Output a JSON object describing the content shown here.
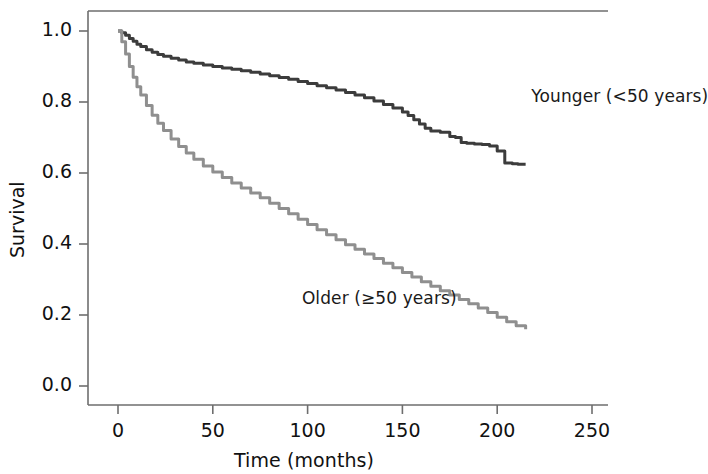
{
  "chart_data": {
    "type": "line",
    "title": "",
    "subtitle": "",
    "xlabel": "Time (months)",
    "ylabel": "Survival",
    "xlim": [
      -12,
      262
    ],
    "ylim": [
      -0.03,
      1.06
    ],
    "xticks": [
      0,
      50,
      100,
      150,
      200,
      250
    ],
    "xtick_labels": [
      "0",
      "50",
      "100",
      "150",
      "200",
      "250"
    ],
    "yticks": [
      0.0,
      0.2,
      0.4,
      0.6,
      0.8,
      1.0
    ],
    "ytick_labels": [
      "0.0",
      "0.2",
      "0.4",
      "0.6",
      "0.8",
      "1.0"
    ],
    "grid": false,
    "legend_position": "inline-annotations",
    "annotations": [
      {
        "text": "Younger (<50 years)",
        "x": 218,
        "y": 0.815,
        "color": "#1a1a1a"
      },
      {
        "text": "Older (≥50 years)",
        "x": 97,
        "y": 0.245,
        "color": "#1a1a1a"
      }
    ],
    "series": [
      {
        "name": "Younger (<50 years)",
        "color": "#3c3c3c",
        "linewidth": 3.0,
        "x": [
          0,
          2,
          4,
          6,
          8,
          10,
          12,
          15,
          18,
          21,
          24,
          28,
          32,
          36,
          40,
          45,
          50,
          55,
          60,
          65,
          70,
          75,
          80,
          85,
          90,
          95,
          100,
          105,
          110,
          115,
          120,
          125,
          130,
          135,
          140,
          145,
          150,
          153,
          156,
          159,
          162,
          165,
          170,
          175,
          178,
          181,
          184,
          188,
          192,
          196,
          200,
          204,
          208,
          211,
          215
        ],
        "y": [
          1.0,
          0.995,
          0.988,
          0.979,
          0.971,
          0.963,
          0.956,
          0.947,
          0.94,
          0.934,
          0.929,
          0.923,
          0.918,
          0.913,
          0.909,
          0.904,
          0.9,
          0.896,
          0.892,
          0.888,
          0.884,
          0.879,
          0.874,
          0.869,
          0.864,
          0.858,
          0.852,
          0.846,
          0.84,
          0.834,
          0.827,
          0.82,
          0.812,
          0.803,
          0.793,
          0.783,
          0.772,
          0.762,
          0.75,
          0.738,
          0.726,
          0.718,
          0.715,
          0.703,
          0.7,
          0.686,
          0.684,
          0.682,
          0.68,
          0.676,
          0.662,
          0.628,
          0.626,
          0.625,
          0.625
        ]
      },
      {
        "name": "Older (≥50 years)",
        "color": "#8f8f8f",
        "linewidth": 3.0,
        "x": [
          0,
          2,
          4,
          6,
          8,
          10,
          12,
          15,
          18,
          21,
          24,
          28,
          32,
          36,
          40,
          45,
          50,
          55,
          60,
          65,
          70,
          75,
          80,
          85,
          90,
          95,
          100,
          105,
          110,
          115,
          120,
          125,
          130,
          135,
          140,
          145,
          150,
          155,
          160,
          165,
          170,
          175,
          180,
          185,
          190,
          195,
          200,
          205,
          210,
          215
        ],
        "y": [
          1.0,
          0.97,
          0.935,
          0.9,
          0.87,
          0.843,
          0.82,
          0.79,
          0.763,
          0.74,
          0.72,
          0.696,
          0.675,
          0.656,
          0.639,
          0.62,
          0.603,
          0.587,
          0.572,
          0.558,
          0.544,
          0.53,
          0.515,
          0.5,
          0.485,
          0.47,
          0.455,
          0.44,
          0.426,
          0.412,
          0.398,
          0.385,
          0.372,
          0.359,
          0.346,
          0.333,
          0.32,
          0.307,
          0.294,
          0.281,
          0.268,
          0.256,
          0.244,
          0.232,
          0.22,
          0.207,
          0.194,
          0.181,
          0.17,
          0.16
        ]
      }
    ]
  },
  "axes": {
    "y_title": "Survival",
    "x_title": "Time (months)"
  },
  "colors": {
    "younger": "#3c3c3c",
    "older": "#8f8f8f",
    "axis": "#6e6e6e",
    "text": "#111111",
    "background": "#ffffff"
  }
}
